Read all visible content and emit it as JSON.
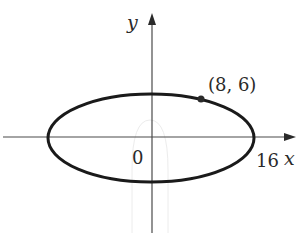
{
  "diagram": {
    "type": "ellipse-on-axes",
    "axes": {
      "x_label": "x",
      "y_label": "y",
      "origin_label": "0"
    },
    "ellipse": {
      "x_intercept_label": "16",
      "point_label": "(8, 6)"
    },
    "colors": {
      "curve": "#1a1a1a",
      "axis": "#4a4a4a",
      "text": "#2a2a2a",
      "background": "#ffffff"
    }
  }
}
